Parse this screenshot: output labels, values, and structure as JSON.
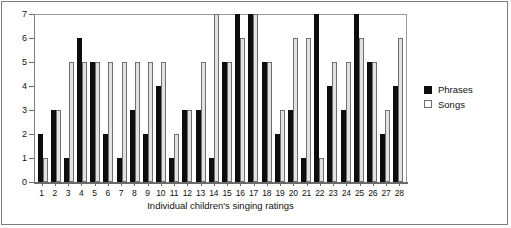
{
  "chart_data": {
    "type": "bar",
    "title": "",
    "xlabel": "Individual children's singing ratings",
    "ylabel": "",
    "ylim": [
      0,
      7
    ],
    "yticks": [
      0,
      1,
      2,
      3,
      4,
      5,
      6,
      7
    ],
    "grid": false,
    "legend_position": "right",
    "categories": [
      "1",
      "2",
      "3",
      "4",
      "5",
      "6",
      "7",
      "8",
      "9",
      "10",
      "11",
      "12",
      "13",
      "14",
      "15",
      "16",
      "17",
      "18",
      "19",
      "20",
      "21",
      "22",
      "23",
      "24",
      "25",
      "26",
      "27",
      "28"
    ],
    "series": [
      {
        "name": "Phrases",
        "color": "#0d0d0d",
        "values": [
          2,
          3,
          1,
          6,
          5,
          2,
          1,
          3,
          2,
          4,
          1,
          3,
          3,
          1,
          5,
          7,
          7,
          5,
          2,
          3,
          1,
          7,
          4,
          3,
          7,
          5,
          2,
          4
        ]
      },
      {
        "name": "Songs",
        "color": "#e2e2e2",
        "values": [
          1,
          3,
          5,
          5,
          5,
          5,
          5,
          5,
          5,
          5,
          2,
          3,
          5,
          7,
          5,
          6,
          7,
          5,
          3,
          6,
          6,
          1,
          5,
          5,
          6,
          5,
          3,
          6
        ]
      }
    ]
  },
  "legend": {
    "items": [
      {
        "label": "Phrases"
      },
      {
        "label": "Songs"
      }
    ]
  },
  "axis": {
    "x_title": "Individual children's singing ratings"
  }
}
